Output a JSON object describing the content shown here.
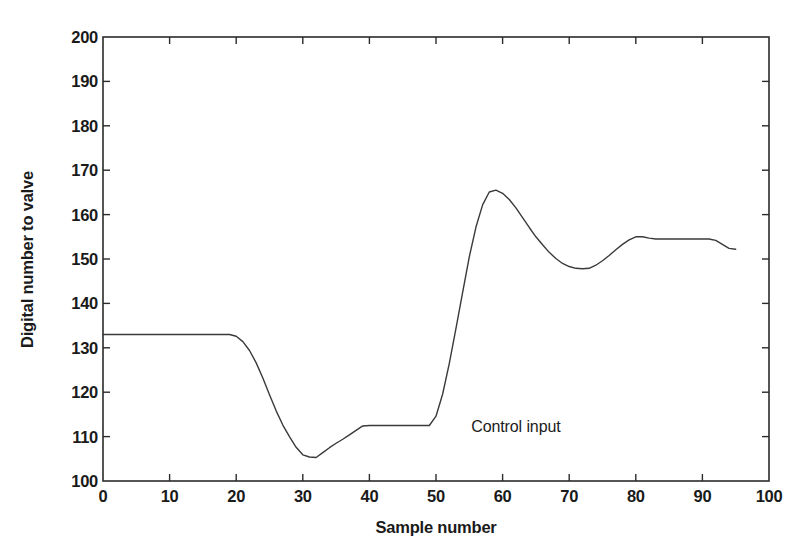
{
  "chart_data": {
    "type": "line",
    "title": "",
    "xlabel": "Sample number",
    "ylabel": "Digital number to valve",
    "xlim": [
      0,
      100
    ],
    "ylim": [
      100,
      200
    ],
    "xticks": [
      0,
      10,
      20,
      30,
      40,
      50,
      60,
      70,
      80,
      90,
      100
    ],
    "yticks": [
      100,
      110,
      120,
      130,
      140,
      150,
      160,
      170,
      180,
      190,
      200
    ],
    "grid": false,
    "legend": "none",
    "annotations": [
      {
        "text": "Control input",
        "x": 62,
        "y": 112
      }
    ],
    "line_color": "#3a3a3a",
    "axis_color": "#2b2b2b",
    "series": [
      {
        "name": "Control input",
        "x": [
          0,
          2,
          4,
          6,
          8,
          10,
          12,
          14,
          16,
          18,
          19,
          20,
          21,
          22,
          23,
          24,
          25,
          26,
          27,
          28,
          29,
          30,
          31,
          32,
          33,
          34,
          35,
          36,
          37,
          38,
          39,
          40,
          42,
          44,
          46,
          48,
          49,
          50,
          51,
          52,
          53,
          54,
          55,
          56,
          57,
          58,
          59,
          60,
          61,
          62,
          63,
          64,
          65,
          66,
          67,
          68,
          69,
          70,
          71,
          72,
          73,
          74,
          75,
          76,
          77,
          78,
          79,
          80,
          81,
          82,
          83,
          84,
          86,
          88,
          90,
          91,
          92,
          93,
          94,
          95
        ],
        "y": [
          133,
          133,
          133,
          133,
          133,
          133,
          133,
          133,
          133,
          133,
          133,
          132.6,
          131.4,
          129.4,
          126.6,
          123.2,
          119.4,
          115.8,
          112.6,
          110,
          107.6,
          105.9,
          105.4,
          105.3,
          106.4,
          107.5,
          108.5,
          109.4,
          110.4,
          111.4,
          112.4,
          112.5,
          112.5,
          112.5,
          112.5,
          112.5,
          112.5,
          114.6,
          119.6,
          126.5,
          134.4,
          142.5,
          150.5,
          157.2,
          162.2,
          165.1,
          165.5,
          164.8,
          163.4,
          161.5,
          159.3,
          157.1,
          155,
          153.2,
          151.5,
          150.1,
          149,
          148.3,
          147.9,
          147.8,
          147.9,
          148.6,
          149.6,
          150.8,
          152.1,
          153.3,
          154.3,
          155,
          155,
          154.7,
          154.5,
          154.5,
          154.5,
          154.5,
          154.5,
          154.5,
          154.2,
          153.3,
          152.4,
          152.2
        ]
      }
    ]
  },
  "axis": {
    "ytick_labels": [
      "200",
      "190",
      "180",
      "170",
      "160",
      "150",
      "140",
      "130",
      "120",
      "110",
      "100"
    ],
    "xtick_labels": [
      "0",
      "10",
      "20",
      "30",
      "40",
      "50",
      "60",
      "70",
      "80",
      "90",
      "100"
    ],
    "xlabel": "Sample number",
    "ylabel": "Digital number to valve"
  },
  "annotation": {
    "control_input": "Control input"
  }
}
